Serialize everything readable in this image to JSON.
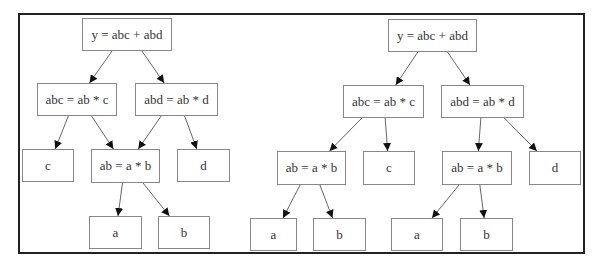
{
  "diagrams": [
    {
      "title": "left-tree-shared",
      "nodes": [
        {
          "id": "y",
          "label": "y = abc + abd",
          "x": 82,
          "y": 18,
          "w": 90,
          "h": 33
        },
        {
          "id": "abc",
          "label": "abc = ab * c",
          "x": 37,
          "y": 83,
          "w": 80,
          "h": 33
        },
        {
          "id": "abd",
          "label": "abd = ab * d",
          "x": 135,
          "y": 83,
          "w": 83,
          "h": 33
        },
        {
          "id": "c",
          "label": "c",
          "x": 22,
          "y": 149,
          "w": 52,
          "h": 33
        },
        {
          "id": "ab",
          "label": "ab = a * b",
          "x": 91,
          "y": 149,
          "w": 69,
          "h": 34
        },
        {
          "id": "d",
          "label": "d",
          "x": 177,
          "y": 149,
          "w": 53,
          "h": 33
        },
        {
          "id": "a",
          "label": "a",
          "x": 89,
          "y": 216,
          "w": 53,
          "h": 33
        },
        {
          "id": "b",
          "label": "b",
          "x": 158,
          "y": 216,
          "w": 52,
          "h": 33
        }
      ],
      "edges": [
        [
          "y",
          "abc"
        ],
        [
          "y",
          "abd"
        ],
        [
          "abc",
          "c"
        ],
        [
          "abc",
          "ab"
        ],
        [
          "abd",
          "ab"
        ],
        [
          "abd",
          "d"
        ],
        [
          "ab",
          "a"
        ],
        [
          "ab",
          "b"
        ]
      ]
    },
    {
      "title": "right-tree-duplicated",
      "nodes": [
        {
          "id": "y",
          "label": "y = abc + abd",
          "x": 388,
          "y": 19,
          "w": 89,
          "h": 33
        },
        {
          "id": "abc",
          "label": "abc = ab * c",
          "x": 343,
          "y": 85,
          "w": 81,
          "h": 33
        },
        {
          "id": "abd",
          "label": "abd = ab * d",
          "x": 441,
          "y": 85,
          "w": 83,
          "h": 33
        },
        {
          "id": "ab1",
          "label": "ab = a * b",
          "x": 277,
          "y": 151,
          "w": 69,
          "h": 34
        },
        {
          "id": "c",
          "label": "c",
          "x": 363,
          "y": 151,
          "w": 52,
          "h": 34
        },
        {
          "id": "ab2",
          "label": "ab = a * b",
          "x": 442,
          "y": 151,
          "w": 70,
          "h": 34
        },
        {
          "id": "d",
          "label": "d",
          "x": 529,
          "y": 151,
          "w": 52,
          "h": 34
        },
        {
          "id": "a1",
          "label": "a",
          "x": 250,
          "y": 218,
          "w": 47,
          "h": 33
        },
        {
          "id": "b1",
          "label": "b",
          "x": 313,
          "y": 218,
          "w": 53,
          "h": 33
        },
        {
          "id": "a2",
          "label": "a",
          "x": 391,
          "y": 218,
          "w": 52,
          "h": 33
        },
        {
          "id": "b2",
          "label": "b",
          "x": 460,
          "y": 218,
          "w": 53,
          "h": 33
        }
      ],
      "edges": [
        [
          "y",
          "abc"
        ],
        [
          "y",
          "abd"
        ],
        [
          "abc",
          "ab1"
        ],
        [
          "abc",
          "c"
        ],
        [
          "abd",
          "ab2"
        ],
        [
          "abd",
          "d"
        ],
        [
          "ab1",
          "a1"
        ],
        [
          "ab1",
          "b1"
        ],
        [
          "ab2",
          "a2"
        ],
        [
          "ab2",
          "b2"
        ]
      ]
    }
  ]
}
